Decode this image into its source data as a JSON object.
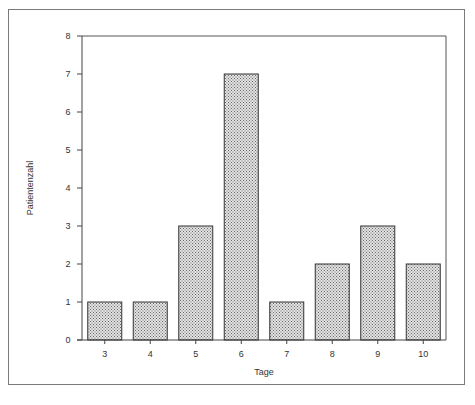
{
  "chart_data": {
    "type": "bar",
    "title": "",
    "xlabel": "Tage",
    "ylabel": "Patientenzahl",
    "categories": [
      "3",
      "4",
      "5",
      "6",
      "7",
      "8",
      "9",
      "10"
    ],
    "values": [
      1,
      1,
      3,
      7,
      1,
      2,
      3,
      2
    ],
    "ylim": [
      0,
      8
    ],
    "yticks": [
      "0",
      "1",
      "2",
      "3",
      "4",
      "5",
      "6",
      "7",
      "8"
    ],
    "grid": false,
    "legend": null,
    "bar_fill": "crosshatch stipple gray",
    "colors": {
      "bar_fill": "#c8c8c8",
      "bar_edge": "#333333",
      "axis": "#444444",
      "frame": "#7a7a7a"
    }
  },
  "caption": {
    "visible_fragment": ""
  }
}
